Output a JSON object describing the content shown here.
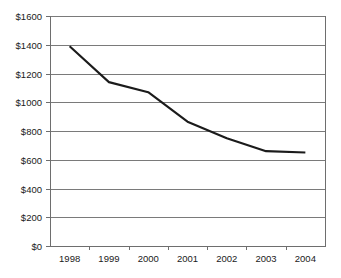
{
  "chart_data": {
    "type": "line",
    "title": "",
    "subtitle": "",
    "xlabel": "",
    "ylabel": "",
    "categories": [
      "1998",
      "1999",
      "2000",
      "2001",
      "2002",
      "2003",
      "2004"
    ],
    "x": [
      "1998",
      "1999",
      "2000",
      "2001",
      "2002",
      "2003",
      "2004"
    ],
    "values": [
      1390,
      1140,
      1070,
      865,
      750,
      660,
      650
    ],
    "series": [
      {
        "name": "",
        "values": [
          1390,
          1140,
          1070,
          865,
          750,
          660,
          650
        ]
      }
    ],
    "ylim": [
      0,
      1600
    ],
    "ytick_step": 200,
    "ytick_values": [
      0,
      200,
      400,
      600,
      800,
      1000,
      1200,
      1400,
      1600
    ],
    "ytick_labels": [
      "$0",
      "$200",
      "$400",
      "$600",
      "$800",
      "$1000",
      "$1200",
      "$1400",
      "$1600"
    ],
    "xtick_labels": [
      "1998",
      "1999",
      "2000",
      "2001",
      "2002",
      "2003",
      "2004"
    ],
    "grid": "horizontal",
    "legend": "none",
    "annotations": []
  },
  "colors": {
    "background": "#ffffff",
    "series_line": "#1b1b1b",
    "gridline": "#7a7a7a",
    "axis": "#6e6e6e",
    "text": "#1a1a1a"
  },
  "plot_geometry": {
    "left": 50,
    "right": 325,
    "top": 16,
    "bottom": 246
  }
}
